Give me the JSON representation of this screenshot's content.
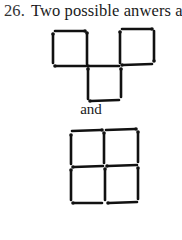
{
  "problem": {
    "number": "26.",
    "statement": "Two possible anwers are:"
  },
  "separator": "and",
  "figures": [
    {
      "name": "answer-1",
      "description": "Three squares: two on top sharing corner points with one square below in the middle",
      "stick_count": 12
    },
    {
      "name": "answer-2",
      "description": "2x2 grid of four squares",
      "stick_count": 12
    }
  ]
}
